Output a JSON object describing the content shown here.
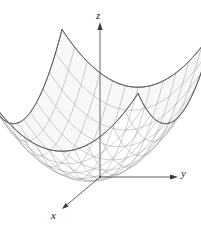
{
  "figure": {
    "title": "",
    "type": "3d-surface-wireframe",
    "background_color": "#ffffff",
    "mesh_color": "#8a8a8a",
    "rim_color": "#5f5f5f",
    "axis_color": "#3a3a3a",
    "fill_color": "#f7f7f7",
    "axes": {
      "z": {
        "label": "z",
        "direction": "up",
        "origin_px": [
          100,
          177
        ],
        "tip_px": [
          100,
          25
        ]
      },
      "y": {
        "label": "y",
        "direction": "right",
        "origin_px": [
          100,
          177
        ],
        "tip_px": [
          176,
          177
        ]
      },
      "x": {
        "label": "x",
        "direction": "down-left",
        "origin_px": [
          100,
          177
        ],
        "tip_px": [
          62,
          209
        ]
      }
    },
    "surface": {
      "equation": "z = x^2 + y^2",
      "u_lines": 13,
      "v_lines": 13,
      "domain": [
        -1,
        1
      ],
      "vertex_px": [
        100,
        177
      ]
    }
  },
  "chart_data": {
    "type": "surface",
    "title": "",
    "xlabel": "x",
    "ylabel": "y",
    "zlabel": "z",
    "equation": "z = x^2 + y^2",
    "x": [
      -1,
      -0.8333,
      -0.6667,
      -0.5,
      -0.3333,
      -0.1667,
      0,
      0.1667,
      0.3333,
      0.5,
      0.6667,
      0.8333,
      1
    ],
    "y": [
      -1,
      -0.8333,
      -0.6667,
      -0.5,
      -0.3333,
      -0.1667,
      0,
      0.1667,
      0.3333,
      0.5,
      0.6667,
      0.8333,
      1
    ],
    "zlim": [
      0,
      2
    ],
    "grid": true,
    "legend": "none"
  }
}
